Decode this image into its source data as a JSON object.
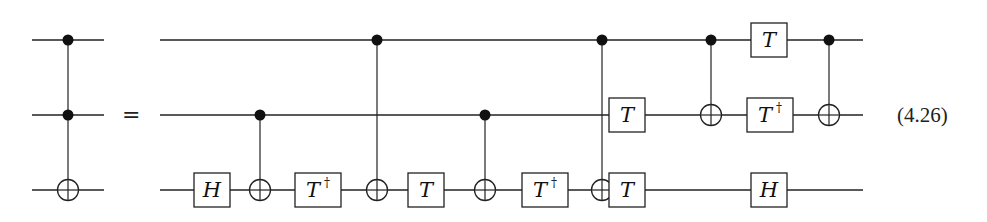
{
  "equation_label": "(4.26)",
  "equals_sign": "=",
  "wire_y": [
    40,
    115,
    190
  ],
  "lhs": {
    "name": "Toffoli gate",
    "x_start": 32,
    "x_end": 104,
    "controls": [
      0,
      1
    ],
    "target": 2,
    "x": 68
  },
  "rhs": {
    "x_start": 160,
    "x_end": 863,
    "gates": [
      {
        "type": "single",
        "label": "H",
        "dagger": false,
        "wire": 2,
        "x": 212
      },
      {
        "type": "cnot",
        "control": 1,
        "target": 2,
        "x": 260
      },
      {
        "type": "single",
        "label": "T",
        "dagger": true,
        "wire": 2,
        "x": 318
      },
      {
        "type": "cnot",
        "control": 0,
        "target": 2,
        "x": 377
      },
      {
        "type": "single",
        "label": "T",
        "dagger": false,
        "wire": 2,
        "x": 426
      },
      {
        "type": "cnot",
        "control": 1,
        "target": 2,
        "x": 485
      },
      {
        "type": "single",
        "label": "T",
        "dagger": true,
        "wire": 2,
        "x": 545
      },
      {
        "type": "cnot",
        "control": 0,
        "target": 2,
        "x": 602
      },
      {
        "type": "single",
        "label": "T",
        "dagger": false,
        "wire": 1,
        "x": 627
      },
      {
        "type": "single",
        "label": "T",
        "dagger": false,
        "wire": 2,
        "x": 627
      },
      {
        "type": "cnot",
        "control": 0,
        "target": 1,
        "x": 711
      },
      {
        "type": "single",
        "label": "T",
        "dagger": false,
        "wire": 0,
        "x": 769
      },
      {
        "type": "single",
        "label": "T",
        "dagger": true,
        "wire": 1,
        "x": 770
      },
      {
        "type": "single",
        "label": "H",
        "dagger": false,
        "wire": 2,
        "x": 769
      },
      {
        "type": "cnot",
        "control": 0,
        "target": 1,
        "x": 829
      }
    ]
  },
  "dagger_symbol": "†"
}
